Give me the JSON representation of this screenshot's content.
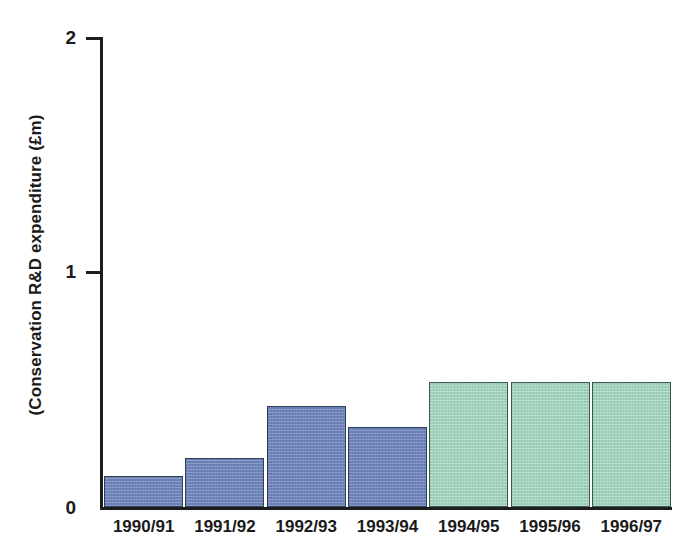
{
  "chart_data": {
    "type": "bar",
    "title": "",
    "subtitle": "",
    "xlabel": "",
    "ylabel": "(Conservation R&D expenditure (£m)",
    "categories": [
      "1990/91",
      "1991/92",
      "1992/93",
      "1993/94",
      "1994/95",
      "1995/96",
      "1996/97"
    ],
    "values": [
      0.13,
      0.21,
      0.43,
      0.34,
      0.53,
      0.53,
      0.53
    ],
    "series": [
      {
        "name": "Conservation R&D expenditure",
        "values": [
          0.13,
          0.21,
          0.43,
          0.34,
          0.53,
          0.53,
          0.53
        ]
      }
    ],
    "bar_colors": [
      "#6d83ba",
      "#6d83ba",
      "#6d83ba",
      "#6d83ba",
      "#9ed2ba",
      "#9ed2ba",
      "#9ed2ba"
    ],
    "ylim": [
      0,
      2
    ],
    "y_ticks": [
      "0",
      "1",
      "2"
    ],
    "y_tick_values": [
      0,
      1,
      2
    ],
    "grid": false,
    "legend": false,
    "legend_position": "none",
    "annotations": []
  },
  "axes": {
    "y": {
      "label": "(Conservation R&D expenditure (£m)",
      "tick_top": "2",
      "tick_mid": "1",
      "tick_bottom": "0"
    },
    "x": {
      "labels": [
        "1990/91",
        "1991/92",
        "1992/93",
        "1993/94",
        "1994/95",
        "1995/96",
        "1996/97"
      ]
    }
  },
  "colors": {
    "bar_blue": "#6d83ba",
    "bar_blue_border": "#2f3f58",
    "bar_green": "#9ed2ba",
    "bar_green_border": "#3b5a4c",
    "axis": "#1d1d1d",
    "text": "#1a1a1a",
    "background": "#ffffff"
  }
}
